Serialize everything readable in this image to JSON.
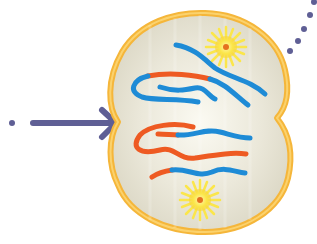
{
  "diagram": {
    "subject": "Dividing cell (cytokinesis) with chromosomes and centrosomes",
    "colors": {
      "background": "#ffffff",
      "arrow": "#5f5f95",
      "dots": "#5f5f95",
      "cell_membrane": "#f5b63a",
      "cell_membrane_light": "#fcd97a",
      "cytoplasm": "#e4e0cf",
      "cytoplasm_highlight": "#fbfaf2",
      "chromosome_blue": "#1e8bd6",
      "chromosome_orange": "#ee5a22",
      "centrosome_rays": "#fbe64a",
      "centrosome_core": "#e5711f"
    },
    "elements": {
      "incoming_arrow": {
        "direction": "right",
        "leading_dot": true
      },
      "outgoing_dot_trail": {
        "count": 5,
        "direction": "up-right"
      },
      "cell": {
        "shape": "pinched-oval",
        "pinch_points": [
          "left",
          "right"
        ]
      },
      "centrosomes": [
        {
          "position": "top-right"
        },
        {
          "position": "bottom-center"
        }
      ],
      "chromosomes": {
        "top_half": 3,
        "bottom_half": 3,
        "color_scheme": [
          "blue",
          "orange"
        ]
      }
    }
  }
}
